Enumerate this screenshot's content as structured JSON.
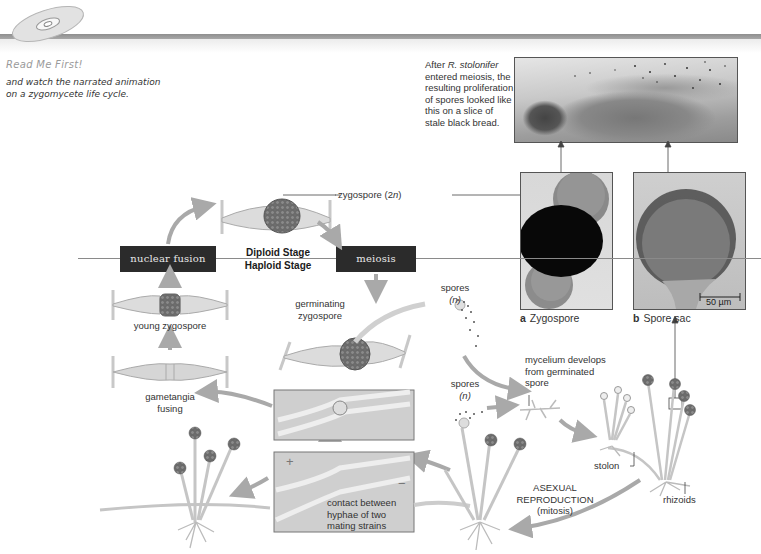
{
  "sidebar_note": {
    "icon": "cd-disc-icon",
    "title": "Read Me First!",
    "body_lines": [
      "and watch the narrated animation",
      "on a zygomycete life cycle."
    ]
  },
  "photo_caption": {
    "prefix": "After ",
    "species": "R. stolonifer",
    "lines": [
      "entered meiosis, the",
      "resulting proliferation",
      "of spores looked like",
      "this on a slice of",
      "stale black bread."
    ]
  },
  "micrographs": [
    {
      "letter": "a",
      "label": "Zygospore"
    },
    {
      "letter": "b",
      "label": "Spore sac",
      "scale_bar": "50 µm"
    }
  ],
  "stages": {
    "diploid": "Diploid Stage",
    "haploid": "Haploid Stage"
  },
  "process_boxes": {
    "nuclear_fusion": "nuclear fusion",
    "meiosis": "meiosis"
  },
  "labels": {
    "zygospore_2n_prefix": "zygospore (2",
    "zygospore_2n_n": "n",
    "zygospore_2n_suffix": ")",
    "young_zygospore": "young zygospore",
    "gametangia_fusing_1": "gametangia",
    "gametangia_fusing_2": "fusing",
    "germinating_1": "germinating",
    "germinating_2": "zygospore",
    "spores_top": "spores",
    "spores_top_n": "(n)",
    "spores_mid": "spores",
    "spores_mid_n": "(n)",
    "mycelium_1": "mycelium develops",
    "mycelium_2": "from germinated",
    "mycelium_3": "spore",
    "stolon": "stolon",
    "rhizoids": "rhizoids",
    "asexual_1": "ASEXUAL",
    "asexual_2": "REPRODUCTION",
    "asexual_3": "(mitosis)",
    "contact_1": "contact between",
    "contact_2": "hyphae of two",
    "contact_3": "mating strains",
    "mating_plus": "+",
    "mating_minus": "−"
  },
  "colors": {
    "box_fill": "#2b2b2b",
    "arrow": "#a9a9a9",
    "zygospore": "#6f6f6f",
    "hyphae": "#d6d6d6"
  }
}
